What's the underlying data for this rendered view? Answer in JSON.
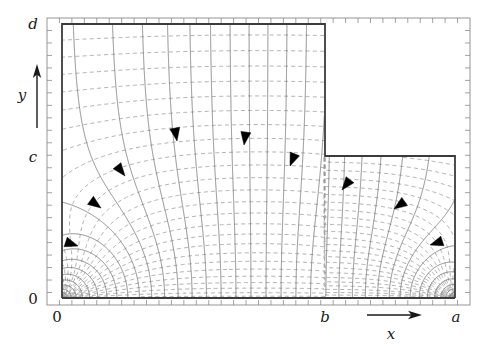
{
  "figure": {
    "domain_kind": "electrostatic-field-map",
    "background": "#ffffff"
  },
  "axes": {
    "x_axis": {
      "label": "x",
      "arrow": "right-arrow",
      "tick_labels": [
        "0",
        "b",
        "a"
      ],
      "tick_label_x_positions": [
        62,
        325,
        455
      ]
    },
    "y_axis": {
      "label": "y",
      "arrow": "up-arrow",
      "tick_labels": [
        "0",
        "c",
        "d"
      ],
      "tick_label_y_positions": [
        298,
        157,
        24
      ]
    }
  },
  "frame": {
    "left": 47,
    "right": 470,
    "top": 18,
    "bottom": 305,
    "color": "#8a8a8a",
    "tick_len": 5,
    "n_ticks_x": 34,
    "n_ticks_y": 23
  },
  "conductor": {
    "name": "stepped-conductor-boundary",
    "color": "#3b3b3b",
    "width": 1.8,
    "x0": 62,
    "x_step": 325,
    "x1": 455,
    "y_bottom": 298,
    "y_c": 156,
    "y_d": 24,
    "outline_points": [
      [
        62,
        298
      ],
      [
        62,
        24
      ],
      [
        325,
        24
      ],
      [
        325,
        156
      ],
      [
        455,
        156
      ],
      [
        455,
        298
      ]
    ]
  },
  "equipotentials": {
    "name": "equipotential-contours",
    "style": "dashed",
    "color": "#9a9a9a",
    "width": 0.8,
    "dash": "4,3.2",
    "count": 26
  },
  "fieldlines": {
    "name": "electric-field-lines",
    "style": "solid",
    "color": "#6e6e6e",
    "width": 0.8,
    "count": 41
  },
  "arrowheads": {
    "name": "field-direction-arrowheads",
    "color": "#000000",
    "count": 9,
    "markers": [
      {
        "x": 78,
        "y": 246,
        "angle": 18
      },
      {
        "x": 101,
        "y": 208,
        "angle": 36
      },
      {
        "x": 125,
        "y": 176,
        "angle": 52
      },
      {
        "x": 177,
        "y": 141,
        "angle": 80
      },
      {
        "x": 244,
        "y": 145,
        "angle": 98
      },
      {
        "x": 290,
        "y": 166,
        "angle": 112
      },
      {
        "x": 342,
        "y": 190,
        "angle": 128
      },
      {
        "x": 394,
        "y": 209,
        "angle": 145
      },
      {
        "x": 430,
        "y": 245,
        "angle": 162
      }
    ]
  },
  "singularities": {
    "name": "corner-singularities",
    "locations": [
      [
        62,
        298
      ],
      [
        455,
        298
      ]
    ],
    "description": "dense radiating field lines and concentric equipotentials"
  },
  "chart_data": {
    "type": "line",
    "title": "",
    "xlabel": "x",
    "ylabel": "y",
    "x_ticks": [
      "0",
      "b",
      "a"
    ],
    "y_ticks": [
      "0",
      "c",
      "d"
    ],
    "series": [
      {
        "name": "equipotentials",
        "style": "dashed"
      },
      {
        "name": "field lines",
        "style": "solid"
      },
      {
        "name": "conductor boundary",
        "style": "solid-thick"
      }
    ]
  }
}
